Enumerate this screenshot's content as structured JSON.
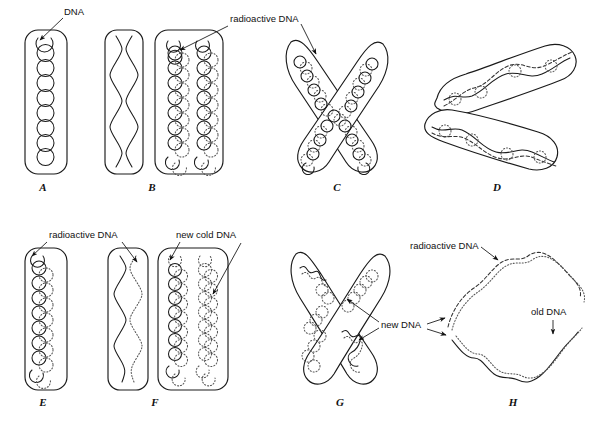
{
  "figure": {
    "background_color": "#ffffff",
    "ink_color": "#1a1a1a",
    "dotted_ink_color": "#555555",
    "width": 597,
    "height": 423
  },
  "panels": [
    {
      "id": "A",
      "letter": "A",
      "description": "Chromosome envelope containing a single coiled DNA helix drawn as a vertical chain of circles",
      "dna_states": [
        "solid"
      ]
    },
    {
      "id": "B1",
      "letter": "",
      "description": "Chromosome envelope containing one double helix drawn as two intertwined wavy strands",
      "dna_states": [
        "solid"
      ]
    },
    {
      "id": "B",
      "letter": "B",
      "description": "Chromosome envelope containing two coiled helices, each half solid and half dotted",
      "dna_states": [
        "solid",
        "dotted"
      ]
    },
    {
      "id": "C",
      "letter": "C",
      "description": "X-shaped chromosome with two crossed chromatids, coiled DNA solid and dotted in each arm",
      "dna_states": [
        "solid",
        "dotted"
      ]
    },
    {
      "id": "D",
      "letter": "D",
      "description": "Two separated boomerang-shaped chromatids, each with a wavy DNA strand plus dashed partner",
      "dna_states": [
        "solid",
        "dashed"
      ]
    },
    {
      "id": "E",
      "letter": "E",
      "description": "Chromosome envelope containing one coiled helix, solid strand paired with dotted strand",
      "dna_states": [
        "solid",
        "dotted"
      ]
    },
    {
      "id": "F1",
      "letter": "",
      "description": "Chromosome envelope containing one wavy solid strand paired with one wavy dotted strand",
      "dna_states": [
        "solid",
        "dotted"
      ]
    },
    {
      "id": "F",
      "letter": "F",
      "description": "Chromosome envelope containing two helices: one solid-with-dotted, one fully dotted",
      "dna_states": [
        "solid",
        "dotted"
      ]
    },
    {
      "id": "G",
      "letter": "G",
      "description": "X-shaped chromosome with crossed chromatids showing new dotted DNA in the arms",
      "dna_states": [
        "solid",
        "dotted"
      ]
    },
    {
      "id": "H",
      "letter": "H",
      "description": "Ring of DNA; upper half dashed radioactive strand, lower half solid old strand with dotted partner",
      "dna_states": [
        "solid",
        "dashed",
        "dotted"
      ]
    }
  ],
  "callouts": [
    {
      "id": "dna-a",
      "text": "DNA",
      "x": 64,
      "y": 14,
      "anchor": "start",
      "leaders": [
        {
          "points": "63,18 38,42",
          "arrow": "38,42"
        }
      ]
    },
    {
      "id": "radioactive-dna-top",
      "text": "radioactive DNA",
      "x": 230,
      "y": 22,
      "anchor": "start",
      "leaders": [
        {
          "points": "228,26 178,48",
          "arrow": "178,48"
        },
        {
          "points": "300,26 318,56",
          "arrow": "318,56"
        }
      ]
    },
    {
      "id": "radioactive-dna-bottom",
      "text": "radioactive DNA",
      "x": 49,
      "y": 238,
      "anchor": "start",
      "leaders": [
        {
          "points": "48,242 30,256",
          "arrow": "30,256"
        },
        {
          "points": "122,242 138,264",
          "arrow": "138,264"
        }
      ]
    },
    {
      "id": "new-cold-dna",
      "text": "new cold DNA",
      "x": 176,
      "y": 238,
      "anchor": "start",
      "leaders": [
        {
          "points": "179,242 168,262",
          "arrow": "168,262"
        },
        {
          "points": "240,244 214,296",
          "arrow": "214,296"
        }
      ]
    },
    {
      "id": "radioactive-dna-h",
      "text": "radioactive DNA",
      "x": 410,
      "y": 249,
      "anchor": "start",
      "leaders": [
        {
          "points": "481,247 500,262",
          "arrow": "500,262"
        }
      ]
    },
    {
      "id": "new-dna",
      "text": "new DNA",
      "x": 381,
      "y": 328,
      "anchor": "start",
      "leaders": [
        {
          "points": "379,322 345,297",
          "arrow": "345,297"
        },
        {
          "points": "379,328 357,341",
          "arrow": "357,341"
        },
        {
          "points": "425,325 447,319",
          "arrow": "447,319"
        },
        {
          "points": "425,330 448,336",
          "arrow": "448,336"
        }
      ]
    },
    {
      "id": "old-dna",
      "text": "old DNA",
      "x": 531,
      "y": 315,
      "anchor": "start",
      "leaders": [
        {
          "points": "553,320 553,336",
          "arrow": "553,336"
        }
      ]
    }
  ]
}
